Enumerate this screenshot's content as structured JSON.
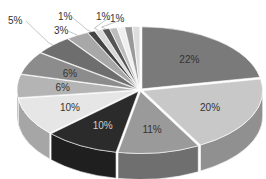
{
  "chart_data": {
    "type": "pie",
    "style": "3d-exploded-grayscale",
    "title": "",
    "legend": "none",
    "slices": [
      {
        "label": "22%",
        "value": 22,
        "color": "#7a7a7a"
      },
      {
        "label": "20%",
        "value": 20,
        "color": "#c8c8c8"
      },
      {
        "label": "11%",
        "value": 11,
        "color": "#9a9a9a"
      },
      {
        "label": "10%",
        "value": 10,
        "color": "#2b2b2b"
      },
      {
        "label": "10%",
        "value": 10,
        "color": "#e6e6e6"
      },
      {
        "label": "6%",
        "value": 6,
        "color": "#b4b4b4"
      },
      {
        "label": "6%",
        "value": 6,
        "color": "#8c8c8c"
      },
      {
        "label": "5%",
        "value": 5,
        "color": "#6e6e6e"
      },
      {
        "label": "3%",
        "value": 3,
        "color": "#a8a8a8"
      },
      {
        "label": "1%",
        "value": 1,
        "color": "#444444"
      },
      {
        "label": "1%",
        "value": 1,
        "color": "#d9d9d9"
      },
      {
        "label": "1%",
        "value": 1,
        "color": "#555555"
      },
      {
        "label": "",
        "value": 1,
        "color": "#bdbdbd"
      },
      {
        "label": "",
        "value": 1,
        "color": "#efefef"
      },
      {
        "label": "",
        "value": 1,
        "color": "#999999"
      },
      {
        "label": "",
        "value": 1,
        "color": "#dddddd"
      }
    ]
  }
}
